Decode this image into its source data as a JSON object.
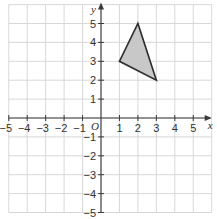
{
  "chart_data": {
    "type": "scatter",
    "title": "",
    "xlabel": "x",
    "ylabel": "y",
    "origin_label": "O",
    "xlim": [
      -5,
      6
    ],
    "ylim": [
      -5,
      6
    ],
    "grid": true,
    "x_ticks": [
      -5,
      -4,
      -3,
      -2,
      -1,
      1,
      2,
      3,
      4,
      5
    ],
    "y_ticks": [
      -5,
      -4,
      -3,
      -2,
      -1,
      1,
      2,
      3,
      4,
      5
    ],
    "x_tick_labels": [
      "−5",
      "−4",
      "−3",
      "−2",
      "−1",
      "1",
      "2",
      "3",
      "4",
      "5"
    ],
    "y_tick_labels": [
      "−5",
      "−4",
      "−3",
      "−2",
      "−1",
      "1",
      "2",
      "3",
      "4",
      "5"
    ],
    "shapes": [
      {
        "name": "triangle",
        "vertices": [
          [
            1,
            3
          ],
          [
            2,
            5
          ],
          [
            3,
            2
          ]
        ],
        "fill": "#c8c8c8",
        "stroke": "#2e2e2e"
      }
    ]
  },
  "colors": {
    "grid": "#d4d4d4",
    "axis": "#3a3a3a",
    "background": "#ffffff"
  }
}
